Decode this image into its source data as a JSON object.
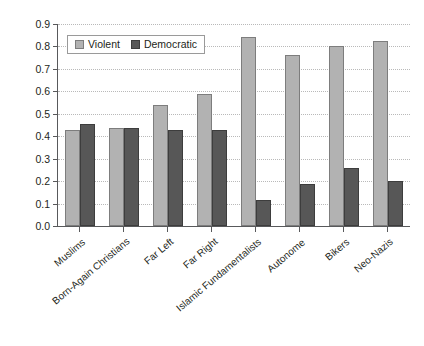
{
  "chart_data": {
    "type": "bar",
    "title": "",
    "subtitle": "",
    "xlabel": "",
    "ylabel": "Scale Score",
    "ylim": [
      0.0,
      0.9
    ],
    "ytick_labels": [
      "0.9",
      "0.8",
      "0.7",
      "0.6",
      "0.5",
      "0.4",
      "0.3",
      "0.2",
      "0.1",
      "0.0"
    ],
    "ytick_values": [
      0.9,
      0.8,
      0.7,
      0.6,
      0.5,
      0.4,
      0.3,
      0.2,
      0.1,
      0.0
    ],
    "grid": true,
    "grid_axis": "y",
    "legend_position": "upper-left-inside",
    "categories": [
      "Muslims",
      "Born-Again Christians",
      "Far Left",
      "Far Right",
      "Islamic Fundamentalists",
      "Autonome",
      "Bikers",
      "Neo-Nazis"
    ],
    "series": [
      {
        "name": "Violent",
        "color": "#b2b2b2",
        "values": [
          0.43,
          0.435,
          0.54,
          0.59,
          0.84,
          0.76,
          0.8,
          0.825
        ]
      },
      {
        "name": "Democratic",
        "color": "#575757",
        "values": [
          0.455,
          0.435,
          0.43,
          0.43,
          0.115,
          0.185,
          0.26,
          0.2
        ]
      }
    ]
  },
  "legend": {
    "entries": [
      {
        "label": "Violent",
        "swatch": "violent"
      },
      {
        "label": "Democratic",
        "swatch": "democratic"
      }
    ]
  },
  "axis": {
    "y_title": "Scale Score"
  }
}
